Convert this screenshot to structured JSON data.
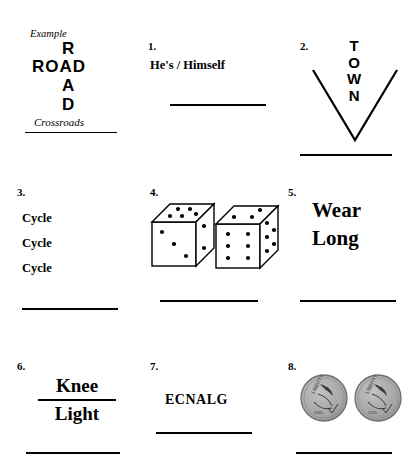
{
  "worksheet": {
    "example": {
      "label": "Example",
      "vertical_word": "ROAD",
      "horizontal_word": "ROAD",
      "vertical_letters": [
        "R",
        "O",
        "A",
        "D"
      ],
      "answer": "Crossroads"
    },
    "puzzles": [
      {
        "number": "1.",
        "type": "text",
        "text": "He's / Himself",
        "answer": ""
      },
      {
        "number": "2.",
        "type": "chevron-word",
        "word": "TOWN",
        "letters": [
          "T",
          "O",
          "W",
          "N"
        ],
        "shape": "v-chevron",
        "answer": ""
      },
      {
        "number": "3.",
        "type": "repeated-text",
        "lines": [
          "Cycle",
          "Cycle",
          "Cycle"
        ],
        "answer": ""
      },
      {
        "number": "4.",
        "type": "dice-image",
        "dice": [
          {
            "name": "left-die",
            "front_pips": 3,
            "top_pips": 5,
            "right_pips": 2
          },
          {
            "name": "right-die",
            "front_pips": 6,
            "top_pips": 3,
            "right_pips": 5
          }
        ],
        "answer": ""
      },
      {
        "number": "5.",
        "type": "stacked-text",
        "lines": [
          "Wear",
          "Long"
        ],
        "answer": ""
      },
      {
        "number": "6.",
        "type": "fraction-text",
        "numerator": "Knee",
        "denominator": "Light",
        "answer": ""
      },
      {
        "number": "7.",
        "type": "text",
        "text": "ECNALG",
        "answer": ""
      },
      {
        "number": "8.",
        "type": "coin-image",
        "coins": [
          {
            "name": "coin-left",
            "inscription": "LIBERTY"
          },
          {
            "name": "coin-right",
            "inscription": "LIBERTY"
          }
        ],
        "answer": ""
      }
    ]
  },
  "colors": {
    "ink": "#000000",
    "page": "#ffffff",
    "coin_face": "#a8a8a8",
    "coin_edge": "#6e6e6e",
    "coin_detail": "#3a3a3a"
  }
}
